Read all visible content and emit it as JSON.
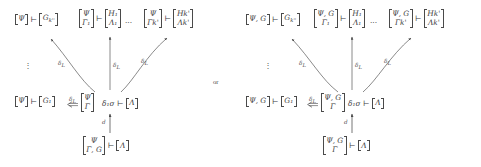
{
  "figure": {
    "connector": "or",
    "turnstile": "⊢",
    "vdots": "⋮",
    "hdots": "···",
    "left_diagram": {
      "name": "left-diagram",
      "top_row": {
        "node_a": {
          "lhs": [
            "Ψ"
          ],
          "rhs": [
            "G",
            "k''"
          ],
          "rhs_text": "G"
        },
        "node_b": {
          "lhs": [
            "Ψ",
            "Γ₁"
          ],
          "rhs": [
            "H₁",
            "Λ₁"
          ]
        },
        "node_c": {
          "lhs": [
            "Ψ",
            "Γk'"
          ],
          "rhs": [
            "Hk'",
            "Λk'"
          ]
        }
      },
      "mid_row": {
        "node_d": {
          "lhs": [
            "Ψ"
          ],
          "rhs": [
            "G₁"
          ]
        },
        "node_e": {
          "lhs": [
            "Ψ",
            "Γ"
          ]
        },
        "sigma": "δ₁σ",
        "node_f": {
          "rhs": [
            "Λ"
          ]
        }
      },
      "bottom_row": {
        "node_g": {
          "lhs": [
            "Ψ",
            "Γ, G"
          ],
          "rhs": [
            "Λ"
          ]
        }
      },
      "labels": {
        "delta_l_1": "δ",
        "delta_l_1_sub": "L",
        "delta_l_2": "δ",
        "delta_l_2_sub": "L",
        "delta_l_3": "δ",
        "delta_l_3_sub": "L",
        "delta_l_4": "δ",
        "delta_l_4_sub": "L",
        "d_label": "d"
      }
    },
    "right_diagram": {
      "name": "right-diagram",
      "top_row": {
        "node_a": {
          "lhs": [
            "Ψ, G"
          ],
          "rhs": [
            "G",
            "k''"
          ],
          "rhs_text": "G"
        },
        "node_b": {
          "lhs": [
            "Ψ, G",
            "Γ₁"
          ],
          "rhs": [
            "H₁",
            "Λ₁"
          ]
        },
        "node_c": {
          "lhs": [
            "Ψ, G",
            "Γk'"
          ],
          "rhs": [
            "Hk'",
            "Λk'"
          ]
        }
      },
      "mid_row": {
        "node_d": {
          "lhs": [
            "Ψ, G"
          ],
          "rhs": [
            "G₁"
          ]
        },
        "node_e": {
          "lhs": [
            "Ψ, G",
            "Γ"
          ]
        },
        "sigma": "δ₁σ",
        "node_f": {
          "rhs": [
            "Λ"
          ]
        }
      },
      "bottom_row": {
        "node_g": {
          "lhs": [
            "Ψ, G",
            "Γ"
          ],
          "rhs": [
            "Λ"
          ]
        }
      },
      "labels": {
        "delta_l_1": "δ",
        "delta_l_1_sub": "L",
        "delta_l_2": "δ",
        "delta_l_2_sub": "L",
        "delta_l_3": "δ",
        "delta_l_3_sub": "L",
        "delta_l_4": "δ",
        "delta_l_4_sub": "L",
        "d_label": "d"
      }
    },
    "symbols": {
      "psi": "Ψ",
      "gamma": "Γ",
      "lambda": "Λ",
      "delta": "δ",
      "sigma": "σ",
      "G": "G",
      "H": "H"
    },
    "colors": {
      "ink": "#3c3c3c",
      "rule": "#4a4a4a",
      "background": "#ffffff"
    }
  }
}
